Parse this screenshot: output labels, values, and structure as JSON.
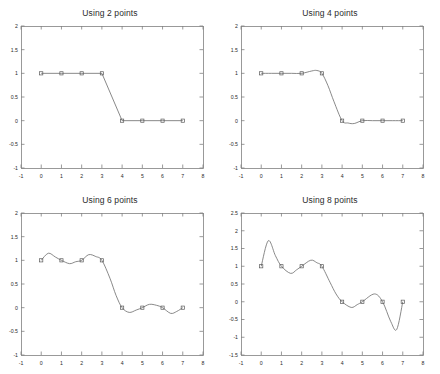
{
  "figure": {
    "background": "#ffffff",
    "axis_color": "#808080",
    "line_color": "#6b6b6b",
    "marker_color": "#5a5a5a",
    "text_color": "#2b2b2b",
    "rows": 2,
    "cols": 2
  },
  "chart_data": [
    {
      "type": "line",
      "title": "Using 2 points",
      "xlabel": "",
      "ylabel": "",
      "xlim": [
        -1,
        8
      ],
      "ylim": [
        -1,
        2
      ],
      "xticks": [
        -1,
        0,
        1,
        2,
        3,
        4,
        5,
        6,
        7,
        8
      ],
      "xticklabels": [
        "-1",
        "0",
        "1",
        "2",
        "3",
        "4",
        "5",
        "6",
        "7",
        "8"
      ],
      "yticks": [
        -1,
        -0.5,
        0,
        0.5,
        1,
        1.5,
        2
      ],
      "yticklabels": [
        "-1",
        "-0.5",
        "0",
        "0.5",
        "1",
        "1.5",
        "2"
      ],
      "grid": false,
      "legend": "none",
      "series": [
        {
          "name": "interpolated curve",
          "x": [
            0,
            1,
            2,
            3,
            4,
            5,
            6,
            7
          ],
          "values": [
            1,
            1,
            1,
            1,
            0,
            0,
            0,
            0
          ],
          "marker": "square",
          "interpolation": "linear"
        }
      ],
      "samples": {
        "x": [
          0,
          1,
          2,
          3,
          4,
          5,
          6,
          7
        ],
        "values": [
          1,
          1,
          1,
          1,
          0,
          0,
          0,
          0
        ]
      }
    },
    {
      "type": "line",
      "title": "Using 4 points",
      "xlabel": "",
      "ylabel": "",
      "xlim": [
        -1,
        8
      ],
      "ylim": [
        -1,
        2
      ],
      "xticks": [
        -1,
        0,
        1,
        2,
        3,
        4,
        5,
        6,
        7,
        8
      ],
      "xticklabels": [
        "-1",
        "0",
        "1",
        "2",
        "3",
        "4",
        "5",
        "6",
        "7",
        "8"
      ],
      "yticks": [
        -1,
        -0.5,
        0,
        0.5,
        1,
        1.5,
        2
      ],
      "yticklabels": [
        "-1",
        "-0.5",
        "0",
        "0.5",
        "1",
        "1.5",
        "2"
      ],
      "grid": false,
      "legend": "none",
      "series": [
        {
          "name": "interpolated curve",
          "x": [
            0,
            0.5,
            1,
            1.5,
            2,
            2.5,
            2.75,
            3,
            3.3,
            3.6,
            4,
            4.3,
            4.6,
            5,
            5.5,
            6,
            6.5,
            7
          ],
          "values": [
            1,
            1,
            1,
            1.0,
            1.0,
            1.05,
            1.06,
            1.0,
            0.74,
            0.4,
            0.0,
            -0.05,
            -0.06,
            0.0,
            0.0,
            0.0,
            0.0,
            0.0
          ],
          "marker": "square",
          "interpolation": "spline"
        }
      ],
      "samples": {
        "x": [
          0,
          1,
          2,
          3,
          4,
          5,
          6,
          7
        ],
        "values": [
          1,
          1,
          1,
          1,
          0,
          0,
          0,
          0
        ]
      }
    },
    {
      "type": "line",
      "title": "Using 6 points",
      "xlabel": "",
      "ylabel": "",
      "xlim": [
        -1,
        8
      ],
      "ylim": [
        -1,
        2
      ],
      "xticks": [
        -1,
        0,
        1,
        2,
        3,
        4,
        5,
        6,
        7,
        8
      ],
      "xticklabels": [
        "-1",
        "0",
        "1",
        "2",
        "3",
        "4",
        "5",
        "6",
        "7",
        "8"
      ],
      "yticks": [
        -1,
        -0.5,
        0,
        0.5,
        1,
        1.5,
        2
      ],
      "yticklabels": [
        "-1",
        "-0.5",
        "0",
        "0.5",
        "1",
        "1.5",
        "2"
      ],
      "grid": false,
      "legend": "none",
      "series": [
        {
          "name": "interpolated curve",
          "x": [
            0,
            0.35,
            0.7,
            1.0,
            1.4,
            1.7,
            2.0,
            2.35,
            2.7,
            3.0,
            3.4,
            3.7,
            4.0,
            4.35,
            4.7,
            5.0,
            5.35,
            5.7,
            6.0,
            6.4,
            6.7,
            7.0
          ],
          "values": [
            1.0,
            1.15,
            1.07,
            1.0,
            0.93,
            0.97,
            1.0,
            1.12,
            1.08,
            1.0,
            0.62,
            0.26,
            0.0,
            -0.1,
            -0.05,
            0.0,
            0.07,
            0.05,
            0.0,
            -0.12,
            -0.08,
            0.0
          ],
          "marker": "square",
          "interpolation": "spline"
        }
      ],
      "samples": {
        "x": [
          0,
          1,
          2,
          3,
          4,
          5,
          6,
          7
        ],
        "values": [
          1,
          1,
          1,
          1,
          0,
          0,
          0,
          0
        ]
      }
    },
    {
      "type": "line",
      "title": "Using 8 points",
      "xlabel": "",
      "ylabel": "",
      "xlim": [
        -1,
        8
      ],
      "ylim": [
        -1.5,
        2.5
      ],
      "xticks": [
        -1,
        0,
        1,
        2,
        3,
        4,
        5,
        6,
        7,
        8
      ],
      "xticklabels": [
        "-1",
        "0",
        "1",
        "2",
        "3",
        "4",
        "5",
        "6",
        "7",
        "8"
      ],
      "yticks": [
        -1.5,
        -1,
        -0.5,
        0,
        0.5,
        1,
        1.5,
        2,
        2.5
      ],
      "yticklabels": [
        "-1.5",
        "-1",
        "-0.5",
        "0",
        "0.5",
        "1",
        "1.5",
        "2",
        "2.5"
      ],
      "grid": false,
      "legend": "none",
      "series": [
        {
          "name": "interpolated curve",
          "x": [
            0,
            0.35,
            0.7,
            1.0,
            1.45,
            1.75,
            2.0,
            2.45,
            2.75,
            3.0,
            3.4,
            3.7,
            4.0,
            4.45,
            4.75,
            5.0,
            5.6,
            6.0,
            6.4,
            6.7,
            7.0
          ],
          "values": [
            1.0,
            1.72,
            1.3,
            1.0,
            0.8,
            0.9,
            1.0,
            1.17,
            1.1,
            1.0,
            0.55,
            0.22,
            0.0,
            -0.16,
            -0.08,
            0.0,
            0.22,
            0.0,
            -0.55,
            -0.78,
            0.0
          ],
          "marker": "square",
          "interpolation": "spline"
        }
      ],
      "samples": {
        "x": [
          0,
          1,
          2,
          3,
          4,
          5,
          6,
          7
        ],
        "values": [
          1,
          1,
          1,
          1,
          0,
          0,
          0,
          0
        ]
      }
    }
  ]
}
